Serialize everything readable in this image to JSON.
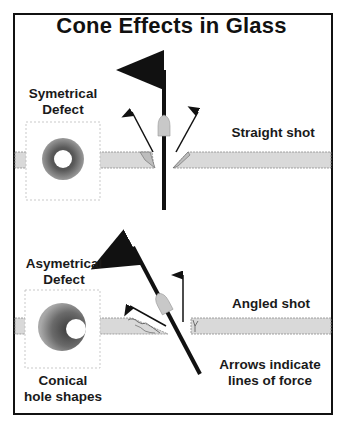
{
  "title": "Cone Effects in Glass",
  "labels": {
    "symmetrical_defect": [
      "Symetrical",
      "Defect"
    ],
    "straight_shot": "Straight shot",
    "asymmetrical_defect": [
      "Asymetrical",
      "Defect"
    ],
    "angled_shot": "Angled shot",
    "conical_hole_shapes": [
      "Conical",
      "hole shapes"
    ],
    "arrows_note": [
      "Arrows indicate",
      "lines of force"
    ]
  },
  "colors": {
    "frame": "#111111",
    "glass_fill": "#d9d9d9",
    "glass_edge": "#8a8a8a",
    "arrow": "#111111",
    "bullet": "#c8c8c8",
    "defect_outer": "#6f6f6f",
    "defect_inner": "#ffffff"
  },
  "diagram": {
    "sections": [
      {
        "name": "straight-shot",
        "label": "Straight shot",
        "defect": "symmetrical"
      },
      {
        "name": "angled-shot",
        "label": "Angled shot",
        "defect": "asymmetrical"
      }
    ]
  }
}
